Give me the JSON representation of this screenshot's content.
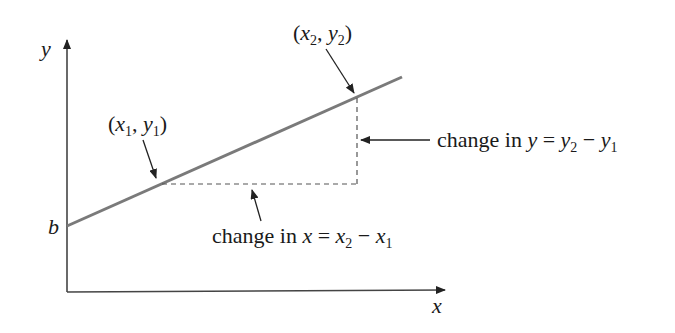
{
  "diagram": {
    "axes": {
      "x_label": "x",
      "y_label": "y",
      "y_intercept_label": "b"
    },
    "points": [
      {
        "label_pre": "(",
        "var1": "x",
        "sub1": "1",
        "sep": ", ",
        "var2": "y",
        "sub2": "1",
        "label_post": ")"
      },
      {
        "label_pre": "(",
        "var1": "x",
        "sub1": "2",
        "sep": ", ",
        "var2": "y",
        "sub2": "2",
        "label_post": ")"
      }
    ],
    "annotations": {
      "change_y": {
        "prefix": "change in ",
        "var": "y",
        "eq": " = ",
        "a": "y",
        "a_sub": "2",
        "minus": " − ",
        "b": "y",
        "b_sub": "1"
      },
      "change_x": {
        "prefix": "change in ",
        "var": "x",
        "eq": " = ",
        "a": "x",
        "a_sub": "2",
        "minus": " − ",
        "b": "x",
        "b_sub": "1"
      }
    },
    "colors": {
      "line": "#7a7a7a",
      "axis": "#444444",
      "text": "#1a1a1a",
      "dash": "#555555"
    }
  }
}
